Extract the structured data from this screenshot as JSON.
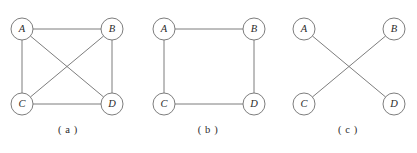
{
  "figure": {
    "type": "graph-diagram-set",
    "background_color": "#ffffff",
    "stroke_color": "#6e6e6e",
    "label_color": "#2b2b2b",
    "node_radius": 11,
    "panels": [
      {
        "caption": "( a )",
        "caption_x": 68,
        "caption_y": 131,
        "nodes": [
          {
            "id": "A",
            "label": "A",
            "x": 22,
            "y": 29
          },
          {
            "id": "B",
            "label": "B",
            "x": 112,
            "y": 29
          },
          {
            "id": "C",
            "label": "C",
            "x": 22,
            "y": 104
          },
          {
            "id": "D",
            "label": "D",
            "x": 112,
            "y": 104
          }
        ],
        "edges": [
          {
            "from": "A",
            "to": "B"
          },
          {
            "from": "A",
            "to": "C"
          },
          {
            "from": "A",
            "to": "D"
          },
          {
            "from": "B",
            "to": "C"
          },
          {
            "from": "B",
            "to": "D"
          },
          {
            "from": "C",
            "to": "D"
          }
        ]
      },
      {
        "caption": "( b )",
        "caption_x": 208,
        "caption_y": 131,
        "nodes": [
          {
            "id": "A",
            "label": "A",
            "x": 164,
            "y": 29
          },
          {
            "id": "B",
            "label": "B",
            "x": 254,
            "y": 29
          },
          {
            "id": "C",
            "label": "C",
            "x": 164,
            "y": 104
          },
          {
            "id": "D",
            "label": "D",
            "x": 254,
            "y": 104
          }
        ],
        "edges": [
          {
            "from": "A",
            "to": "B"
          },
          {
            "from": "A",
            "to": "C"
          },
          {
            "from": "B",
            "to": "D"
          },
          {
            "from": "C",
            "to": "D"
          }
        ]
      },
      {
        "caption": "( c )",
        "caption_x": 348,
        "caption_y": 131,
        "nodes": [
          {
            "id": "A",
            "label": "A",
            "x": 304,
            "y": 29
          },
          {
            "id": "B",
            "label": "B",
            "x": 394,
            "y": 29
          },
          {
            "id": "C",
            "label": "C",
            "x": 304,
            "y": 104
          },
          {
            "id": "D",
            "label": "D",
            "x": 394,
            "y": 104
          }
        ],
        "edges": [
          {
            "from": "A",
            "to": "D"
          },
          {
            "from": "B",
            "to": "C"
          }
        ]
      }
    ]
  }
}
